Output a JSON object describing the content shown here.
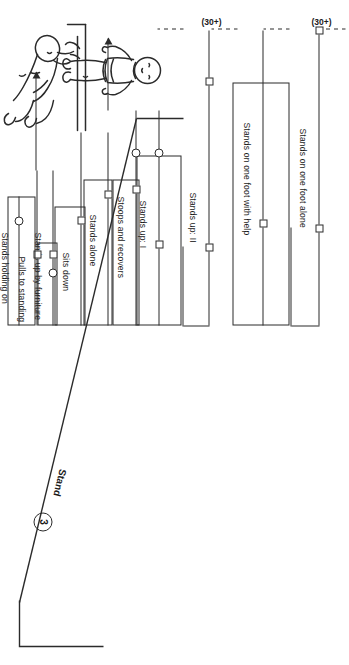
{
  "figure": {
    "section_label": "Stand",
    "section_number": "3",
    "kind": "developmental-milestone-sequence-chart"
  },
  "milestones": [
    {
      "id": "stands-on-one-foot-alone",
      "label": "Stands on one foot alone",
      "age_note": "(30+)",
      "markers": [
        "square"
      ]
    },
    {
      "id": "stands-on-one-foot-with-help",
      "label": "Stands on one foot with help",
      "age_note": "(30+)",
      "markers": [
        "square"
      ]
    },
    {
      "id": "stands-up-2",
      "label": "Stands up: II",
      "age_note": "",
      "markers": [
        "square"
      ]
    },
    {
      "id": "stands-up-1",
      "label": "Stands up: I",
      "age_note": "",
      "markers": [
        "square",
        "circle"
      ]
    },
    {
      "id": "stoops-and-recovers",
      "label": "Stoops and recovers",
      "age_note": "",
      "markers": [
        "circle",
        "square"
      ]
    },
    {
      "id": "stands-alone",
      "label": "Stands alone",
      "age_note": "",
      "markers": [
        "square"
      ]
    },
    {
      "id": "sits-down",
      "label": "Sits down",
      "age_note": "",
      "markers": [
        "square"
      ]
    },
    {
      "id": "stands-up-by-furniture",
      "label": "Stands up by furniture",
      "age_note": "",
      "markers": [
        "square",
        "circle"
      ]
    },
    {
      "id": "pulls-to-standing",
      "label": "Pulls to standing",
      "age_note": "",
      "markers": [
        "square"
      ]
    },
    {
      "id": "stands-holding-on",
      "label": "Stands holding on",
      "age_note": "",
      "markers": [
        "circle"
      ]
    }
  ],
  "age_notes": {
    "upper": "(30+)",
    "lower": "(30+)"
  },
  "illustrations": [
    {
      "id": "child-standing-alone",
      "caption_target": "Stands alone"
    },
    {
      "id": "child-pulling-to-stand",
      "caption_target": "Pulls to standing"
    }
  ],
  "colors": {
    "ink": "#2b2b2b",
    "paper": "#ffffff"
  }
}
